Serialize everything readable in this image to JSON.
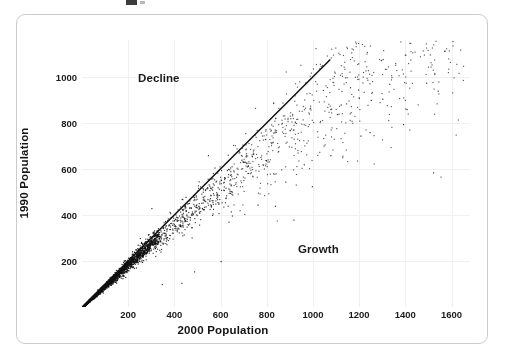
{
  "figure": {
    "frame_color": "#c9cbcd",
    "background": "#ffffff",
    "point_color": "#111111",
    "line_color": "#101010",
    "grid_color": "#f0f0f1",
    "title_remnant": ""
  },
  "chart_data": {
    "type": "scatter",
    "title": "",
    "xlabel": "2000 Population",
    "ylabel": "1990 Population",
    "xlim": [
      0,
      1680
    ],
    "ylim": [
      0,
      1160
    ],
    "xticks": [
      200,
      400,
      600,
      800,
      1000,
      1200,
      1400,
      1600
    ],
    "yticks": [
      200,
      400,
      600,
      800,
      1000
    ],
    "xtick_labels": [
      "200",
      "400",
      "600",
      "800",
      "1000",
      "1200",
      "1400",
      "1600"
    ],
    "ytick_labels": [
      "200",
      "400",
      "600",
      "800",
      "1000"
    ],
    "grid": true,
    "legend": false,
    "annotations": [
      {
        "text": "Decline",
        "x": 290,
        "y": 1010,
        "region": "above-diagonal"
      },
      {
        "text": "Growth",
        "x": 940,
        "y": 330,
        "region": "below-diagonal"
      }
    ],
    "reference_line": {
      "type": "identity",
      "label": "y = x",
      "x_start": 0,
      "y_start": 0,
      "x_end": 1075,
      "y_end": 1075
    },
    "n_points": 2400,
    "series": [
      {
        "name": "towns",
        "marker": "dot",
        "color": "#111111",
        "size": 1.2,
        "points_summary": {
          "core_cluster_x_range": [
            10,
            600
          ],
          "core_cluster_y_range": [
            10,
            600
          ],
          "spread_increases_with_x": true,
          "majority_below_identity": true,
          "max_x_observed": 1660,
          "max_y_observed": 1060
        }
      }
    ]
  },
  "axes": {
    "x_ticks": [
      "200",
      "400",
      "600",
      "800",
      "1000",
      "1200",
      "1400",
      "1600"
    ],
    "y_ticks": [
      "1000",
      "800",
      "600",
      "400",
      "200"
    ],
    "x_title": "2000 Population",
    "y_title": "1990 Population"
  },
  "annotations": {
    "decline": "Decline",
    "growth": "Growth"
  }
}
